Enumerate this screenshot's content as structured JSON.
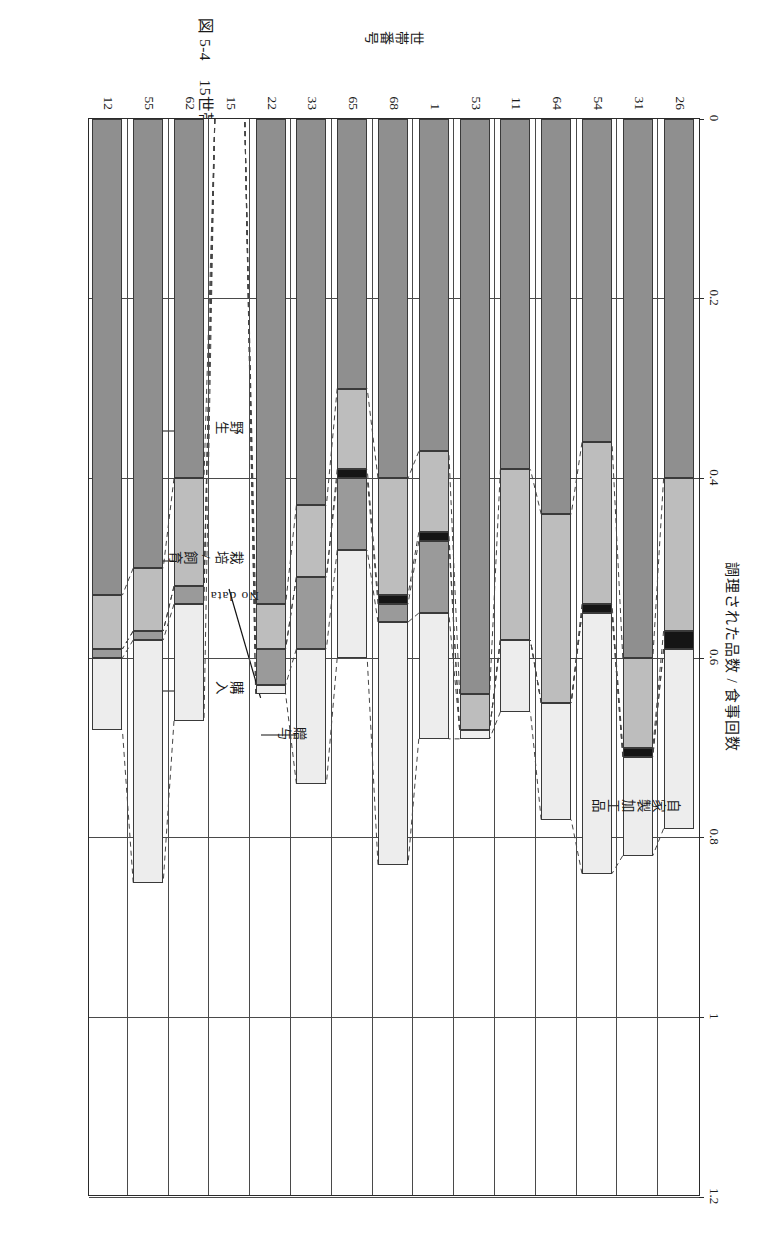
{
  "figure": {
    "caption_number": "図 5-4",
    "caption_text": "15世帯の主な食材の由来（雨期）"
  },
  "chart_data": {
    "type": "bar",
    "orientation": "horizontal-stacked",
    "title": "15世帯の主な食材の由来（雨期）",
    "xlabel": "調理された品数 / 食事回数",
    "ylabel": "世帯番号",
    "xlim": [
      0,
      1.2
    ],
    "xticks": [
      "0",
      "0.2",
      "0.4",
      "0.6",
      "0.8",
      "1",
      "1.2"
    ],
    "xtick_values": [
      0,
      0.2,
      0.4,
      0.6,
      0.8,
      1,
      1.2
    ],
    "grid": true,
    "legend_position": "inline-callouts",
    "categories": [
      "26",
      "31",
      "54",
      "64",
      "11",
      "53",
      "1",
      "68",
      "65",
      "33",
      "22",
      "15",
      "62",
      "55",
      "12"
    ],
    "series": [
      {
        "name": "野生",
        "key": "wild",
        "color": "#8f8f8f",
        "values": [
          0.4,
          0.6,
          0.36,
          0.44,
          0.39,
          0.64,
          0.37,
          0.4,
          0.3,
          0.43,
          0.54,
          0,
          0.4,
          0.5,
          0.53
        ]
      },
      {
        "name": "栽培/飼育",
        "key": "culti",
        "color": "#bdbdbd",
        "values": [
          0.17,
          0.1,
          0.18,
          0.21,
          0.19,
          0.04,
          0.09,
          0.13,
          0.09,
          0.08,
          0.05,
          0,
          0.12,
          0.07,
          0.06
        ]
      },
      {
        "name": "自家製加工品",
        "key": "home",
        "color": "#151515",
        "values": [
          0.02,
          0.01,
          0.01,
          0.0,
          0.0,
          0.0,
          0.01,
          0.01,
          0.01,
          0.0,
          0.0,
          0,
          0.0,
          0.0,
          0.0
        ]
      },
      {
        "name": "贈与",
        "key": "gift",
        "color": "#9a9a9a",
        "values": [
          0.0,
          0.0,
          0.0,
          0.0,
          0.0,
          0.0,
          0.08,
          0.02,
          0.08,
          0.08,
          0.04,
          0,
          0.02,
          0.01,
          0.01
        ]
      },
      {
        "name": "購入",
        "key": "buy",
        "color": "#ededed",
        "values": [
          0.2,
          0.11,
          0.29,
          0.13,
          0.08,
          0.01,
          0.14,
          0.27,
          0.12,
          0.15,
          0.01,
          0,
          0.13,
          0.27,
          0.08
        ]
      },
      {
        "name": "No data",
        "key": "nodata",
        "color": "#ffffff",
        "values": [
          0,
          0,
          0,
          0,
          0,
          0,
          0,
          0,
          0,
          0,
          0,
          0,
          0,
          0,
          0
        ]
      }
    ],
    "annotations": [
      {
        "text": "自家製加工品",
        "target_category": "31"
      },
      {
        "text": "No data",
        "target_category": "15"
      },
      {
        "text": "野生",
        "target_category": "62"
      },
      {
        "text": "栽培/飼育",
        "target_category": "62"
      },
      {
        "text": "贈与",
        "target_category": "22"
      },
      {
        "text": "購入",
        "target_category": "62"
      }
    ]
  },
  "labels": {
    "axis_title_x": "調理された品数 / 食事回数",
    "axis_title_y": "世帯番号",
    "callout_home": "自家製加工品",
    "callout_nodata": "No data",
    "callout_wild": "野生",
    "callout_culti": "栽培/飼育",
    "callout_gift": "贈与",
    "callout_buy": "購入"
  }
}
